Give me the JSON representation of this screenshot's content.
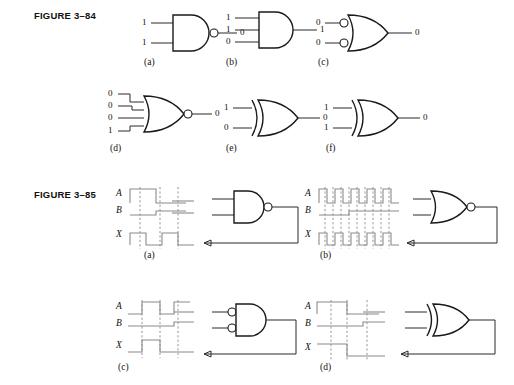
{
  "page": {
    "width": 514,
    "height": 385,
    "background": "#ffffff",
    "ink": "#1a1a1a",
    "wire_color": "#2a2a2a",
    "timing_color": "#8a8a8a"
  },
  "figures": [
    {
      "id": "figure-3-84",
      "label": "FIGURE 3–84",
      "label_x": 34,
      "label_y": 10,
      "items": [
        {
          "key": "a",
          "caption": "(a)",
          "caption_x": 144,
          "caption_y": 57,
          "gate": "nand",
          "inverted_inputs": false,
          "output_bubble": true,
          "inputs": [
            "1",
            "1"
          ],
          "output": "0",
          "x": 143,
          "y": 12
        },
        {
          "key": "b",
          "caption": "(b)",
          "caption_x": 226,
          "caption_y": 57,
          "gate": "and",
          "inverted_inputs": false,
          "output_bubble": false,
          "inputs": [
            "1",
            "1",
            "0"
          ],
          "output": "1",
          "x": 225,
          "y": 10
        },
        {
          "key": "c",
          "caption": "(c)",
          "caption_x": 318,
          "caption_y": 57,
          "gate": "or",
          "inverted_inputs": true,
          "output_bubble": false,
          "inputs": [
            "0",
            "0"
          ],
          "output": "0",
          "x": 316,
          "y": 12
        },
        {
          "key": "d",
          "caption": "(d)",
          "caption_x": 110,
          "caption_y": 143,
          "gate": "nor",
          "inverted_inputs": false,
          "output_bubble": true,
          "inputs": [
            "0",
            "0",
            "0",
            "1"
          ],
          "output": "0",
          "x": 108,
          "y": 88
        },
        {
          "key": "e",
          "caption": "(e)",
          "caption_x": 226,
          "caption_y": 143,
          "gate": "xor",
          "inverted_inputs": false,
          "output_bubble": false,
          "inputs": [
            "1",
            "0"
          ],
          "output": "0",
          "x": 224,
          "y": 97
        },
        {
          "key": "f",
          "caption": "(f)",
          "caption_x": 326,
          "caption_y": 143,
          "gate": "xor",
          "inverted_inputs": false,
          "output_bubble": false,
          "inputs": [
            "1",
            "1"
          ],
          "output": "0",
          "x": 324,
          "y": 97
        }
      ]
    },
    {
      "id": "figure-3-85",
      "label": "FIGURE 3–85",
      "label_x": 34,
      "label_y": 189,
      "items": [
        {
          "key": "a",
          "caption": "(a)",
          "caption_x": 144,
          "caption_y": 250,
          "gate": "nand",
          "inverted_inputs": false,
          "output_bubble": true,
          "signals": [
            "A",
            "B",
            "X"
          ],
          "x": 130,
          "y": 186,
          "pattern": "slow"
        },
        {
          "key": "b",
          "caption": "(b)",
          "caption_x": 320,
          "caption_y": 250,
          "gate": "nor",
          "inverted_inputs": false,
          "output_bubble": true,
          "signals": [
            "A",
            "B",
            "X"
          ],
          "x": 320,
          "y": 186,
          "pattern": "fast"
        },
        {
          "key": "c",
          "caption": "(c)",
          "caption_x": 118,
          "caption_y": 362,
          "gate": "and",
          "inverted_inputs": true,
          "output_bubble": false,
          "signals": [
            "A",
            "B",
            "X"
          ],
          "x": 130,
          "y": 300,
          "pattern": "narrow"
        },
        {
          "key": "d",
          "caption": "(d)",
          "caption_x": 320,
          "caption_y": 362,
          "gate": "xor",
          "inverted_inputs": false,
          "output_bubble": false,
          "signals": [
            "A",
            "B",
            "X"
          ],
          "x": 320,
          "y": 300,
          "pattern": "wide"
        }
      ]
    }
  ]
}
